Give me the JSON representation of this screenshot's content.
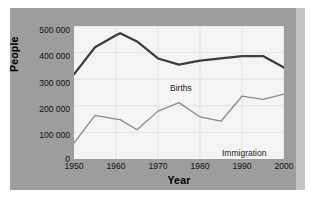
{
  "chart_data": {
    "type": "line",
    "title": "",
    "xlabel": "Year",
    "ylabel": "People",
    "xlim": [
      1950,
      2000
    ],
    "ylim": [
      0,
      500000
    ],
    "grid": true,
    "legend_position": "inline-annotations",
    "xticks": [
      "1950",
      "1960",
      "1970",
      "1980",
      "1990",
      "2000"
    ],
    "xtick_values": [
      1950,
      1960,
      1970,
      1980,
      1990,
      2000
    ],
    "yticks": [
      "0",
      "100 000",
      "200 000",
      "300 000",
      "400 000",
      "500 000"
    ],
    "ytick_values": [
      0,
      100000,
      200000,
      300000,
      400000,
      500000
    ],
    "x": [
      1950,
      1955,
      1960,
      1961,
      1965,
      1970,
      1975,
      1980,
      1985,
      1990,
      1995,
      2000
    ],
    "series": [
      {
        "name": "Births",
        "color": "#3c3c3c",
        "width": 2.2,
        "values": [
          318000,
          420000,
          465000,
          473000,
          442000,
          378000,
          355000,
          370000,
          378000,
          387000,
          387000,
          344000
        ]
      },
      {
        "name": "Immigration",
        "color": "#8a8a8a",
        "width": 1.3,
        "values": [
          60000,
          164000,
          150000,
          148000,
          110000,
          180000,
          212000,
          158000,
          142000,
          236000,
          224000,
          244000
        ]
      }
    ],
    "annotations": [
      {
        "text": "Births",
        "x": 1959,
        "y": 352000
      },
      {
        "text": "Immigration",
        "x": 1972,
        "y": 107000
      }
    ],
    "colors": {
      "panel_background": "#9d9d9d",
      "panel_edge": "#c3c3c3",
      "plot_background": "#f4f4f4",
      "grid": "#e3e3e3",
      "axis_text": "#111111",
      "births_line": "#3c3c3c",
      "immigration_line": "#8a8a8a"
    }
  }
}
